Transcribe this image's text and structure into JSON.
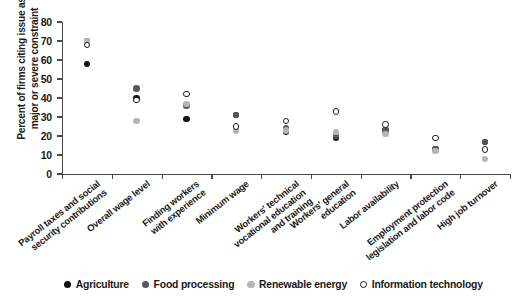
{
  "chart_data": {
    "type": "scatter",
    "title": "",
    "subtitle": "",
    "xlabel": "",
    "ylabel": "Percent of firms citing issue as major or severe constraint",
    "ylim": [
      0,
      80
    ],
    "yticks": [
      0,
      10,
      20,
      30,
      40,
      50,
      60,
      70,
      80
    ],
    "grid": false,
    "legend_position": "bottom",
    "categories": [
      "Payroll taxes and social\nsecurity contributions",
      "Overall wage level",
      "Finding workers\nwith experience",
      "Minimum wage",
      "Workers' technical\nvocational education\nand training",
      "Workers' general\neducation",
      "Labor availability",
      "Employment protection\nlegislation and labor code",
      "High job turnover"
    ],
    "series": [
      {
        "name": "Agriculture",
        "color": "#111111",
        "marker": "filled",
        "values": [
          58,
          40,
          29,
          31,
          22,
          19,
          23,
          13,
          17
        ]
      },
      {
        "name": "Food processing",
        "color": "#585858",
        "marker": "filled",
        "values": [
          70,
          45,
          36,
          31,
          24,
          20,
          23,
          13,
          17
        ]
      },
      {
        "name": "Renewable energy",
        "color": "#b4b4b4",
        "marker": "filled",
        "values": [
          70,
          28,
          37,
          23,
          23,
          22,
          21,
          12,
          8
        ]
      },
      {
        "name": "Information technology",
        "color": "#111111",
        "marker": "open",
        "values": [
          68,
          39,
          42,
          25,
          28,
          33,
          26,
          19,
          13
        ]
      }
    ]
  },
  "legend": {
    "items": [
      {
        "label": "Agriculture",
        "color": "#111111",
        "marker": "filled"
      },
      {
        "label": "Food processing",
        "color": "#585858",
        "marker": "filled"
      },
      {
        "label": "Renewable energy",
        "color": "#b4b4b4",
        "marker": "filled"
      },
      {
        "label": "Information technology",
        "color": "#111111",
        "marker": "open"
      }
    ]
  },
  "axes": {
    "y_title": "Percent of firms citing issue as major or severe constraint"
  }
}
